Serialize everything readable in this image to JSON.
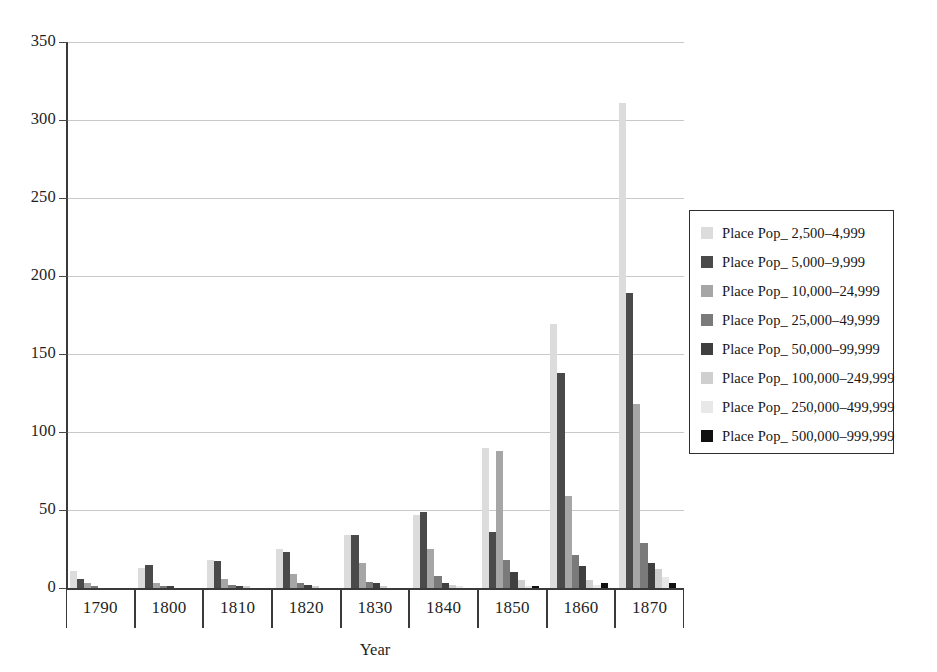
{
  "chart_data": {
    "type": "bar",
    "title": "",
    "xlabel": "Year",
    "ylabel": "",
    "ylim": [
      0,
      350
    ],
    "ytick_step": 50,
    "yticks": [
      350,
      300,
      250,
      200,
      150,
      100,
      50,
      0
    ],
    "grid": true,
    "legend_position": "right",
    "categories": [
      "1790",
      "1800",
      "1810",
      "1820",
      "1830",
      "1840",
      "1850",
      "1860",
      "1870"
    ],
    "series": [
      {
        "name": "Place Pop_ 2,500–4,999",
        "color": "#dcdcdc",
        "values": [
          11,
          13,
          18,
          25,
          34,
          47,
          90,
          169,
          311
        ]
      },
      {
        "name": "Place Pop_ 5,000–9,999",
        "color": "#4a4a4a",
        "values": [
          6,
          15,
          17,
          23,
          34,
          49,
          36,
          138,
          189
        ]
      },
      {
        "name": "Place Pop_ 10,000–24,999",
        "color": "#a6a6a6",
        "values": [
          3,
          3,
          6,
          9,
          16,
          25,
          88,
          59,
          118
        ]
      },
      {
        "name": "Place Pop_ 25,000–49,999",
        "color": "#7a7a7a",
        "values": [
          1,
          1,
          2,
          3,
          4,
          8,
          18,
          21,
          29
        ]
      },
      {
        "name": "Place Pop_ 50,000–99,999",
        "color": "#3f3f3f",
        "values": [
          0,
          1,
          1,
          2,
          3,
          3,
          10,
          14,
          16
        ]
      },
      {
        "name": "Place Pop_ 100,000–249,999",
        "color": "#cfcfcf",
        "values": [
          0,
          0,
          1,
          1,
          1,
          2,
          5,
          5,
          12
        ]
      },
      {
        "name": "Place Pop_ 250,000–499,999",
        "color": "#e8e8e8",
        "values": [
          0,
          0,
          0,
          0,
          0,
          1,
          1,
          2,
          7
        ]
      },
      {
        "name": "Place Pop_ 500,000–999,999",
        "color": "#111111",
        "values": [
          0,
          0,
          0,
          0,
          0,
          0,
          1,
          3,
          3
        ]
      }
    ]
  }
}
